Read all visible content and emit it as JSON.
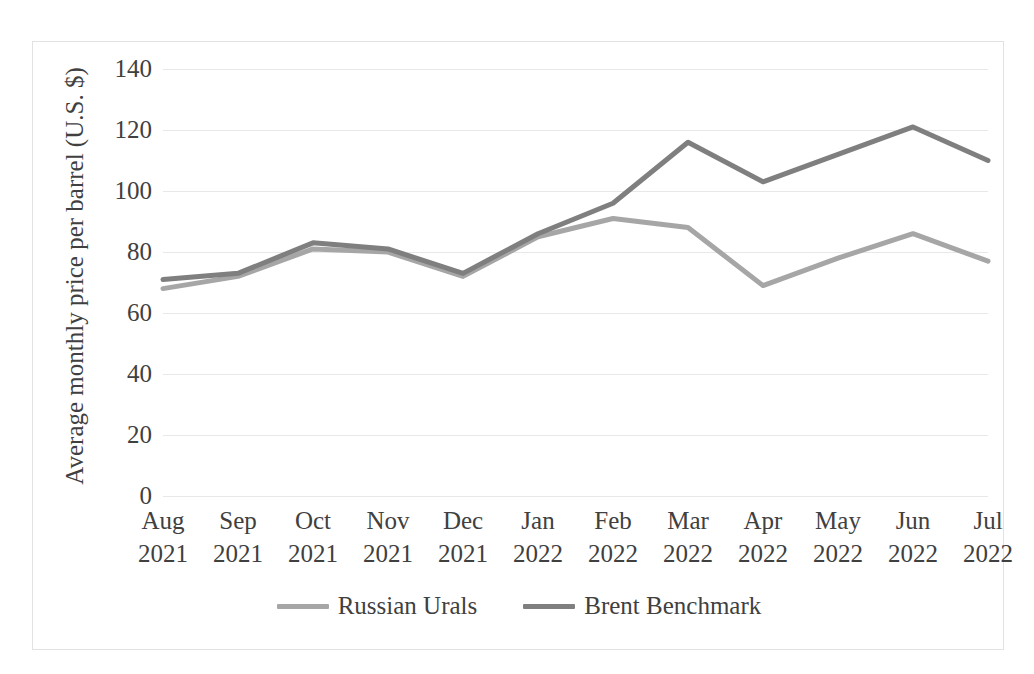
{
  "chart_data": {
    "type": "line",
    "title": "",
    "subtitle": "",
    "xlabel": "",
    "ylabel": "Average monthly price per barrel (U.S. $)",
    "categories": [
      "Aug 2021",
      "Sep 2021",
      "Oct 2021",
      "Nov 2021",
      "Dec 2021",
      "Jan 2022",
      "Feb 2022",
      "Mar 2022",
      "Apr 2022",
      "May 2022",
      "Jun 2022",
      "Jul 2022"
    ],
    "category_months": [
      "Aug",
      "Sep",
      "Oct",
      "Nov",
      "Dec",
      "Jan",
      "Feb",
      "Mar",
      "Apr",
      "May",
      "Jun",
      "Jul"
    ],
    "category_years": [
      "2021",
      "2021",
      "2021",
      "2021",
      "2021",
      "2022",
      "2022",
      "2022",
      "2022",
      "2022",
      "2022",
      "2022"
    ],
    "series": [
      {
        "name": "Russian Urals",
        "color": "#a6a6a6",
        "values": [
          68,
          72,
          81,
          80,
          72,
          85,
          91,
          88,
          69,
          78,
          86,
          77
        ]
      },
      {
        "name": "Brent Benchmark",
        "color": "#7f7f7f",
        "values": [
          71,
          73,
          83,
          81,
          73,
          86,
          96,
          116,
          103,
          112,
          121,
          110
        ]
      }
    ],
    "ylim": [
      0,
      140
    ],
    "ytick_values": [
      0,
      20,
      40,
      60,
      80,
      100,
      120,
      140
    ],
    "ytick_labels": [
      "0",
      "20",
      "40",
      "60",
      "80",
      "100",
      "120",
      "140"
    ],
    "grid": true,
    "grid_axis": "y",
    "grid_color": "#e8e8e8",
    "legend_position": "bottom",
    "border_color": "#e2e2e2",
    "background": "#ffffff"
  }
}
